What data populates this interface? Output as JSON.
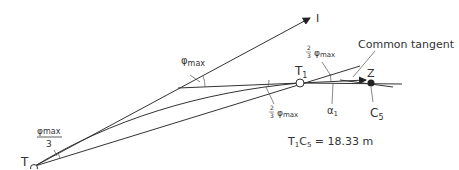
{
  "diagram": {
    "points": {
      "T": "T",
      "I": "I",
      "T1": {
        "base": "T",
        "sub": "1"
      },
      "Z": "Z",
      "C5": {
        "base": "C",
        "sub": "5"
      }
    },
    "angles": {
      "phi_max_at_vertex": {
        "symbol": "φ",
        "sub": "max"
      },
      "phi_max_over_3": {
        "numerator_symbol": "φ",
        "numerator_sub": "max",
        "denominator": "3"
      },
      "two_thirds_phi_upper": {
        "num": "2",
        "den": "3",
        "symbol": "φ",
        "sub": "max"
      },
      "two_thirds_phi_lower": {
        "num": "2",
        "den": "3",
        "symbol": "φ",
        "sub": "max"
      },
      "alpha1": {
        "symbol": "α",
        "sub": "1"
      }
    },
    "callout": "Common tangent",
    "measurement": {
      "t": "T",
      "t_sub": "1",
      "c": "C",
      "c_sub": "5",
      "rest": " = 18.33 m"
    },
    "colors": {
      "line": "#333333",
      "background": "#ffffff"
    }
  }
}
